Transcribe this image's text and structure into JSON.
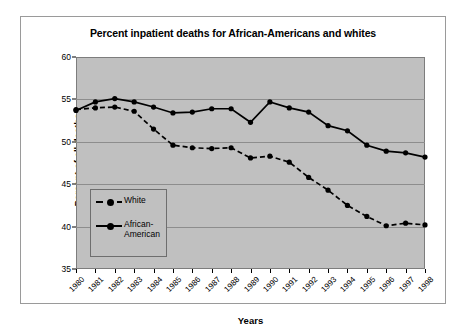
{
  "chart_data": {
    "type": "line",
    "title": "Percent inpatient deaths for African-Americans and whites",
    "xlabel": "Years",
    "ylabel": "Percent of all deaths",
    "ylim": [
      35,
      60
    ],
    "ytick_step": 5,
    "yticks": [
      35,
      40,
      45,
      50,
      55,
      60
    ],
    "grid": true,
    "legend_position": "inside-left",
    "categories": [
      "1980",
      "1981",
      "1982",
      "1983",
      "1984",
      "1985",
      "1986",
      "1987",
      "1988",
      "1989",
      "1990",
      "1991",
      "1992",
      "1993",
      "1994",
      "1995",
      "1996",
      "1997",
      "1998"
    ],
    "series": [
      {
        "name": "White",
        "style": "dashed",
        "values": [
          53.8,
          54.0,
          54.1,
          53.6,
          51.5,
          49.6,
          49.3,
          49.2,
          49.3,
          48.1,
          48.3,
          47.6,
          45.8,
          44.3,
          42.5,
          41.2,
          40.1,
          40.4,
          40.2
        ]
      },
      {
        "name": "African-American",
        "style": "solid",
        "values": [
          53.7,
          54.7,
          55.1,
          54.7,
          54.1,
          53.4,
          53.5,
          53.9,
          53.9,
          52.3,
          54.7,
          54.0,
          53.5,
          51.9,
          51.3,
          49.6,
          48.9,
          48.7,
          48.2
        ]
      }
    ]
  },
  "legend": {
    "entries": [
      {
        "label": "White"
      },
      {
        "label": "African-American"
      }
    ]
  },
  "colors": {
    "plot_background": "#c0c0c0",
    "page_background": "#ffffff",
    "series_line": "#000000",
    "gridline": "#8d8d8d",
    "frame_border": "#9a9a9a"
  }
}
